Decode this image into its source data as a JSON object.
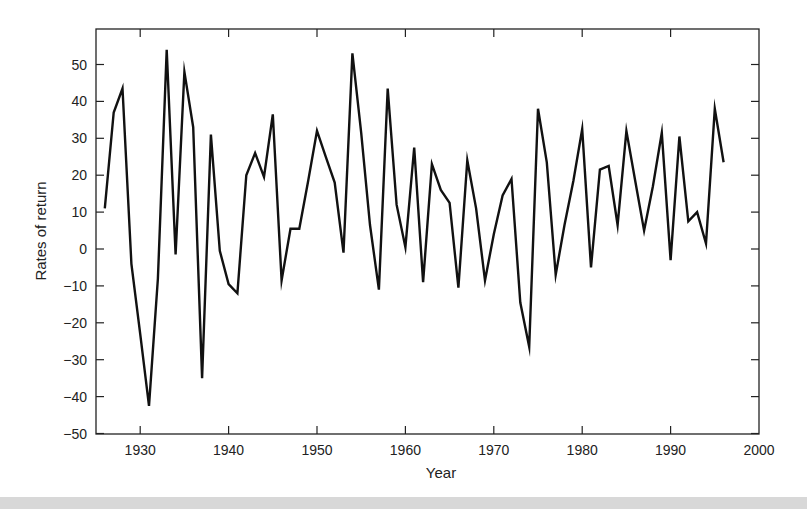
{
  "chart_data": {
    "type": "line",
    "title": "",
    "xlabel": "Year",
    "ylabel": "Rates of return",
    "xlim": [
      1925,
      2000
    ],
    "ylim": [
      -50,
      55
    ],
    "x_ticks": [
      1930,
      1940,
      1950,
      1960,
      1970,
      1980,
      1990,
      2000
    ],
    "y_ticks": [
      50,
      40,
      30,
      20,
      10,
      0,
      -10,
      -20,
      -30,
      -40,
      -50
    ],
    "grid": false,
    "legend": null,
    "series": [
      {
        "name": "Rates of return",
        "color": "#111111",
        "x": [
          1926,
          1927,
          1928,
          1929,
          1930,
          1931,
          1932,
          1933,
          1934,
          1935,
          1936,
          1937,
          1938,
          1939,
          1940,
          1941,
          1942,
          1943,
          1944,
          1945,
          1946,
          1947,
          1948,
          1949,
          1950,
          1951,
          1952,
          1953,
          1954,
          1955,
          1956,
          1957,
          1958,
          1959,
          1960,
          1961,
          1962,
          1963,
          1964,
          1965,
          1966,
          1967,
          1968,
          1969,
          1970,
          1971,
          1972,
          1973,
          1974,
          1975,
          1976,
          1977,
          1978,
          1979,
          1980,
          1981,
          1982,
          1983,
          1984,
          1985,
          1986,
          1987,
          1988,
          1989,
          1990,
          1991,
          1992,
          1993,
          1994,
          1995,
          1996
        ],
        "values": [
          11.0,
          37.0,
          43.5,
          -4.0,
          -23.0,
          -42.5,
          -8.0,
          54.0,
          -1.5,
          48.0,
          33.0,
          -35.0,
          31.0,
          -0.5,
          -9.5,
          -12.0,
          20.0,
          26.0,
          19.5,
          36.5,
          -8.5,
          5.5,
          5.5,
          18.5,
          32.0,
          25.0,
          18.0,
          -1.0,
          53.0,
          31.5,
          6.5,
          -11.0,
          43.5,
          12.0,
          0.5,
          27.5,
          -9.0,
          23.0,
          16.0,
          12.5,
          -10.5,
          24.0,
          11.0,
          -8.5,
          4.0,
          14.5,
          19.0,
          -14.5,
          -26.5,
          38.0,
          23.5,
          -7.0,
          6.5,
          18.5,
          32.5,
          -5.0,
          21.5,
          22.5,
          6.5,
          32.0,
          18.5,
          5.0,
          17.0,
          31.5,
          -3.0,
          30.5,
          7.5,
          10.0,
          1.5,
          38.0,
          23.5
        ]
      }
    ]
  },
  "axes": {
    "xlabel": "Year",
    "ylabel": "Rates of return",
    "x_tick_labels": [
      "1930",
      "1940",
      "1950",
      "1960",
      "1970",
      "1980",
      "1990",
      "2000"
    ],
    "y_tick_labels": [
      "50",
      "40",
      "30",
      "20",
      "10",
      "0",
      "−10",
      "−20",
      "−30",
      "−40",
      "−50"
    ]
  }
}
